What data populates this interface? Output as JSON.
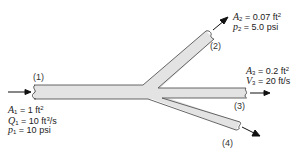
{
  "diagram": {
    "type": "pipe-branch-flow",
    "colors": {
      "pipe_fill": "#e3e3e3",
      "pipe_edge": "#555555",
      "arrow": "#111111",
      "text": "#222222"
    },
    "sections": [
      {
        "id": "1",
        "label": "(1)"
      },
      {
        "id": "2",
        "label": "(2)"
      },
      {
        "id": "3",
        "label": "(3)"
      },
      {
        "id": "4",
        "label": "(4)"
      }
    ],
    "section1": {
      "area_sym": "A",
      "area_sub": "1",
      "area_val": "= 1 ft",
      "area_exp": "2",
      "flow_sym": "Q",
      "flow_sub": "1",
      "flow_val": "= 10 ft",
      "flow_exp": "3",
      "flow_unit": "/s",
      "pressure_sym": "p",
      "pressure_sub": "1",
      "pressure_val": "= 10 psi"
    },
    "section2": {
      "area_sym": "A",
      "area_sub": "2",
      "area_val": "= 0.07 ft",
      "area_exp": "2",
      "pressure_sym": "p",
      "pressure_sub": "2",
      "pressure_val": "= 5.0 psi"
    },
    "section3": {
      "area_sym": "A",
      "area_sub": "3",
      "area_val": "= 0.2 ft",
      "area_exp": "2",
      "velocity_sym": "V",
      "velocity_sub": "3",
      "velocity_val": "= 20 ft/s"
    }
  }
}
